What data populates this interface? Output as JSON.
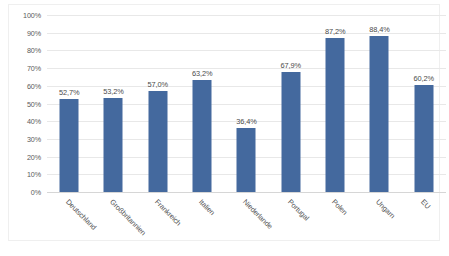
{
  "chart_data": {
    "type": "bar",
    "title": "",
    "subtitle": "",
    "xlabel": "",
    "ylabel": "",
    "ylim": [
      0,
      100
    ],
    "grid": true,
    "legend": "none",
    "orientation": "vertical",
    "label_rotation_deg": 45,
    "value_format": "percent-comma-one-decimal",
    "bar_color": "#44699E",
    "gridline_color": "#E8E8E8",
    "axis_text_color": "#5A5A5A",
    "categories": [
      "Deutschland",
      "Großbritannien",
      "Frankreich",
      "Italien",
      "Niederlande",
      "Portugal",
      "Polen",
      "Ungarn",
      "EU"
    ],
    "values": [
      52.7,
      53.2,
      57.0,
      63.2,
      36.4,
      67.9,
      87.2,
      88.4,
      60.2
    ],
    "value_labels": [
      "52,7%",
      "53,2%",
      "57,0%",
      "63,2%",
      "36,4%",
      "67,9%",
      "87,2%",
      "88,4%",
      "60,2%"
    ],
    "yticks": [
      0,
      10,
      20,
      30,
      40,
      50,
      60,
      70,
      80,
      90,
      100
    ],
    "ytick_labels": [
      "0%",
      "10%",
      "20%",
      "30%",
      "40%",
      "50%",
      "60%",
      "70%",
      "80%",
      "90%",
      "100%"
    ]
  }
}
